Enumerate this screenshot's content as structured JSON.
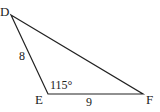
{
  "diagram": {
    "type": "triangle",
    "vertices": [
      {
        "name": "D",
        "x": 11,
        "y": 15
      },
      {
        "name": "E",
        "x": 48,
        "y": 94
      },
      {
        "name": "F",
        "x": 143,
        "y": 94
      }
    ],
    "side_labels": {
      "DE": "8",
      "EF": "9"
    },
    "angle_label": {
      "vertex": "E",
      "text": "115°"
    },
    "stroke_color": "#222222"
  }
}
